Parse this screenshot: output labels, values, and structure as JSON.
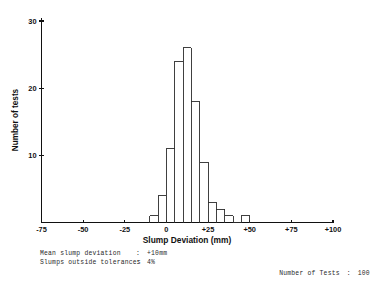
{
  "chart_data": {
    "type": "bar",
    "title": "",
    "xlabel": "Slump Deviation (mm)",
    "ylabel": "Number of tests",
    "xlim": [
      -75,
      100
    ],
    "ylim": [
      0,
      31
    ],
    "grid": false,
    "legend": "none",
    "bin_width": 5,
    "xticks": [
      "-75",
      "-50",
      "-25",
      "0",
      "+25",
      "+50",
      "+75",
      "+100"
    ],
    "xtick_values": [
      -75,
      -50,
      -25,
      0,
      25,
      50,
      75,
      100
    ],
    "yticks": [
      "10",
      "20",
      "30"
    ],
    "ytick_values": [
      10,
      20,
      30
    ],
    "categories": [
      -10,
      -5,
      0,
      5,
      10,
      15,
      20,
      25,
      30,
      35,
      40,
      45
    ],
    "values": [
      1,
      4,
      11,
      24,
      26,
      18,
      9,
      3,
      2,
      1,
      0,
      1
    ],
    "series": [
      {
        "name": "Number of tests",
        "values": [
          1,
          4,
          11,
          24,
          26,
          18,
          9,
          3,
          2,
          1,
          0,
          1
        ]
      }
    ]
  },
  "footer": {
    "left": [
      {
        "key": "Mean slump deviation",
        "sep": ":",
        "value": "+10mm"
      },
      {
        "key": "Slumps outside tolerances",
        "sep": ":",
        "value": "4%"
      }
    ],
    "right": {
      "key": "Number of Tests",
      "sep": ":",
      "value": "100"
    }
  }
}
